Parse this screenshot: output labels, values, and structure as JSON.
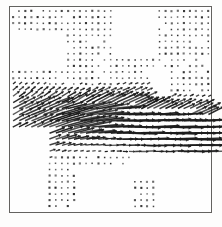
{
  "figure": {
    "title": "",
    "frame": {
      "x": 9,
      "y": 6,
      "width": 203,
      "height": 207,
      "border_color": "#63625f"
    },
    "background_color": "#fdfdfc",
    "arrow_color": "#1b1b1b"
  },
  "chart_data": {
    "type": "scatter",
    "plot_kind": "quiver",
    "title": "",
    "subtitle": "",
    "xlabel": "",
    "ylabel": "",
    "xlim": [
      0,
      33
    ],
    "ylim": [
      0,
      33
    ],
    "grid": false,
    "legend": null,
    "tick_labels": {
      "x": [],
      "y": []
    },
    "annotations": [],
    "grid_spacing_px": 6.1,
    "origin_px": [
      13,
      11
    ],
    "max_arrow_length_px": 26,
    "field_regions": [
      {
        "name": "upper-dot-field",
        "magnitude": "near-zero",
        "direction_deg": 0,
        "note": "uniform small dots across the top two-thirds"
      },
      {
        "name": "central-jet",
        "magnitude": "large",
        "direction_deg": 5,
        "note": "long horizontal arrows through the middle-right"
      },
      {
        "name": "shear-ramp",
        "magnitude": "medium",
        "direction_deg": 28,
        "note": "up-right angled arrows along the diagonal band"
      },
      {
        "name": "lower-sparse",
        "magnitude": "near-zero",
        "direction_deg": 0,
        "note": "isolated dots below the jet"
      }
    ],
    "vectors": [
      {
        "col": 1,
        "row": 1,
        "u": 0.06,
        "v": 0.0
      },
      {
        "col": 2,
        "row": 1,
        "u": 0.06,
        "v": 0.0
      },
      {
        "col": 3,
        "row": 1,
        "u": 0.06,
        "v": 0.0
      },
      {
        "col": 4,
        "row": 1,
        "u": 0.06,
        "v": 0.0
      },
      {
        "col": 5,
        "row": 1,
        "u": 0.06,
        "v": 0.0
      },
      {
        "col": 6,
        "row": 1,
        "u": 0.06,
        "v": 0.0
      },
      {
        "col": 7,
        "row": 1,
        "u": 0.06,
        "v": 0.0
      },
      {
        "col": 8,
        "row": 1,
        "u": 0.06,
        "v": 0.0
      },
      {
        "col": 9,
        "row": 1,
        "u": 0.06,
        "v": 0.0
      },
      {
        "col": 10,
        "row": 1,
        "u": 0.06,
        "v": 0.0
      },
      {
        "col": 11,
        "row": 1,
        "u": 0.06,
        "v": 0.0
      },
      {
        "col": 12,
        "row": 1,
        "u": 0.06,
        "v": 0.0
      },
      {
        "col": 13,
        "row": 1,
        "u": 0.06,
        "v": 0.0
      },
      {
        "col": 14,
        "row": 1,
        "u": 0.06,
        "v": 0.0
      },
      {
        "col": 15,
        "row": 1,
        "u": 0.06,
        "v": 0.0
      },
      {
        "col": 16,
        "row": 1,
        "u": 0.06,
        "v": 0.0
      },
      {
        "col": 17,
        "row": 1,
        "u": 0.06,
        "v": 0.0
      },
      {
        "col": 18,
        "row": 1,
        "u": 0.06,
        "v": 0.0
      },
      {
        "col": 19,
        "row": 1,
        "u": 0.06,
        "v": 0.0
      },
      {
        "col": 20,
        "row": 1,
        "u": 0.06,
        "v": 0.0
      },
      {
        "col": 21,
        "row": 1,
        "u": 0.06,
        "v": 0.0
      },
      {
        "col": 22,
        "row": 1,
        "u": 0.06,
        "v": 0.0
      },
      {
        "col": 23,
        "row": 1,
        "u": 0.06,
        "v": 0.0
      },
      {
        "col": 24,
        "row": 1,
        "u": 0.06,
        "v": 0.0
      },
      {
        "col": 25,
        "row": 1,
        "u": 0.06,
        "v": 0.0
      },
      {
        "col": 26,
        "row": 1,
        "u": 0.06,
        "v": 0.0
      },
      {
        "col": 27,
        "row": 1,
        "u": 0.06,
        "v": 0.0
      },
      {
        "col": 28,
        "row": 1,
        "u": 0.06,
        "v": 0.0
      },
      {
        "col": 29,
        "row": 1,
        "u": 0.06,
        "v": 0.0
      },
      {
        "col": 30,
        "row": 1,
        "u": 0.06,
        "v": 0.0
      },
      {
        "col": 14,
        "row": 16,
        "u": 3.1,
        "v": 0.5
      },
      {
        "col": 15,
        "row": 16,
        "u": 3.4,
        "v": 0.5
      },
      {
        "col": 16,
        "row": 17,
        "u": 3.8,
        "v": 0.4
      },
      {
        "col": 17,
        "row": 17,
        "u": 4.0,
        "v": 0.3
      },
      {
        "col": 18,
        "row": 18,
        "u": 4.2,
        "v": 0.2
      },
      {
        "col": 19,
        "row": 18,
        "u": 4.3,
        "v": 0.1
      },
      {
        "col": 20,
        "row": 19,
        "u": 4.4,
        "v": 0.0
      },
      {
        "col": 21,
        "row": 19,
        "u": 4.3,
        "v": 0.0
      },
      {
        "col": 22,
        "row": 20,
        "u": 4.1,
        "v": 0.0
      },
      {
        "col": 23,
        "row": 20,
        "u": 3.8,
        "v": 0.0
      }
    ]
  }
}
